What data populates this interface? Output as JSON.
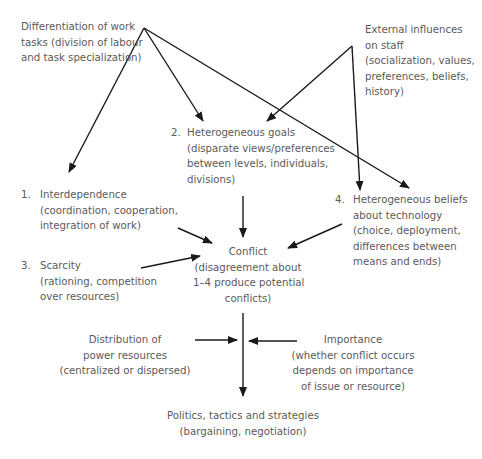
{
  "diagram": {
    "nodes": {
      "differentiation": {
        "lines": [
          "Differentiation of work",
          "tasks (division of labour",
          "and task specialization)"
        ]
      },
      "external": {
        "lines": [
          "External influences",
          "on staff",
          "(socialization, values,",
          "preferences, beliefs,",
          "history)"
        ]
      },
      "goals": {
        "number": "2.",
        "lines": [
          "Heterogeneous goals",
          "(disparate views/preferences",
          "between levels, individuals,",
          "divisions)"
        ]
      },
      "interdependence": {
        "number": "1.",
        "lines": [
          "Interdependence",
          "(coordination, cooperation,",
          "integration of work)"
        ]
      },
      "beliefs": {
        "number": "4.",
        "lines": [
          "Heterogeneous beliefs",
          "about technology",
          "(choice, deployment,",
          "differences between",
          "means and ends)"
        ]
      },
      "scarcity": {
        "number": "3.",
        "lines": [
          "Scarcity",
          "(rationing, competition",
          "over resources)"
        ]
      },
      "conflict": {
        "lines": [
          "Conflict",
          "(disagreement about",
          "1–4 produce potential",
          "conflicts)"
        ]
      },
      "distribution": {
        "lines": [
          "Distribution of",
          "power resources",
          "(centralized or dispersed)"
        ]
      },
      "importance": {
        "lines": [
          "Importance",
          "(whether conflict occurs",
          "depends on importance",
          "of issue or resource)"
        ]
      },
      "politics": {
        "lines": [
          "Politics, tactics and strategies",
          "(bargaining, negotiation)"
        ]
      }
    },
    "edges": [
      {
        "from": "differentiation",
        "to": "interdependence"
      },
      {
        "from": "differentiation",
        "to": "goals"
      },
      {
        "from": "differentiation",
        "to": "beliefs"
      },
      {
        "from": "external",
        "to": "goals"
      },
      {
        "from": "external",
        "to": "beliefs"
      },
      {
        "from": "goals",
        "to": "conflict"
      },
      {
        "from": "interdependence",
        "to": "conflict"
      },
      {
        "from": "scarcity",
        "to": "conflict"
      },
      {
        "from": "beliefs",
        "to": "conflict"
      },
      {
        "from": "conflict",
        "to": "politics"
      },
      {
        "from": "distribution",
        "to": "politics"
      },
      {
        "from": "importance",
        "to": "politics"
      }
    ],
    "colors": {
      "text": "#5a5a5a",
      "line": "#1a1a1a",
      "background": "#ffffff"
    }
  }
}
